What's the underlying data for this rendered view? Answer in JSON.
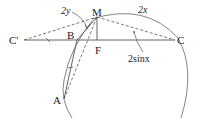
{
  "diagram": {
    "type": "geometry",
    "points": {
      "C_prime": {
        "label": "C'",
        "x": 24,
        "y": 40
      },
      "B": {
        "label": "B",
        "x": 76,
        "y": 40
      },
      "M": {
        "label": "M",
        "x": 97,
        "y": 17
      },
      "F": {
        "label": "F",
        "x": 97,
        "y": 40
      },
      "C": {
        "label": "C",
        "x": 175,
        "y": 40
      },
      "A": {
        "label": "A",
        "x": 64,
        "y": 99
      }
    },
    "annotations": {
      "angle_2y": "2y",
      "arc_2x": "2x",
      "chord_2sinx": "2sinx"
    },
    "colors": {
      "line": "#555555",
      "text": "#222222",
      "background": "#ffffff"
    }
  }
}
